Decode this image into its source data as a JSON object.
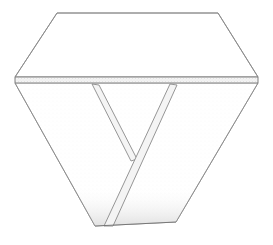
{
  "figure": {
    "title": "",
    "type": "line-drawing",
    "background_color": "#ffffff",
    "stroke_color": "#8a8a8a",
    "stroke_color_dark": "#6f6f6f",
    "stroke_width": 0.9,
    "canvas": {
      "width": 273,
      "height": 245
    },
    "fills": {
      "top_face": "#ffffff",
      "band_face": "#f2f2f2",
      "strut_face": "#f4f4f4",
      "bottom_face": "#ffffff"
    },
    "stipple": {
      "band_color": "#9a9a9a",
      "bottom_color": "#d8d8d8",
      "band_opacity": 0.55,
      "bottom_opacity": 0.35
    },
    "vertices": {
      "top_left_apex": [
        57,
        13
      ],
      "top_right_apex": [
        218,
        13
      ],
      "left_band_top": [
        15,
        77
      ],
      "right_band_top": [
        258,
        77
      ],
      "left_band_bottom": [
        15,
        83
      ],
      "right_band_bottom": [
        258,
        83
      ],
      "bottom_left": [
        95,
        226
      ],
      "bottom_right": [
        176,
        222
      ],
      "strut_left_top_outer": [
        92,
        84
      ],
      "strut_left_top_inner": [
        99,
        85
      ],
      "strut_vee_bottom": [
        131,
        161
      ],
      "strut_right_top_outer": [
        170,
        84
      ],
      "strut_right_top_inner": [
        177,
        85
      ],
      "strut_right_bottom_outer": [
        104,
        226
      ],
      "strut_right_bottom_inner": [
        113,
        226
      ]
    },
    "paths": {
      "top_face": "M 57,13 L 218,13 L 258,77 L 15,77 Z",
      "band": "M 15,77 L 258,77 L 258,83 L 15,83 Z",
      "bottom_face": "M 15,83 L 95,226 L 176,222 L 258,83 Z",
      "left_strut": "M 92,84 L 131,161 L 137,159 L 99,85 Z",
      "right_strut": "M 170,84 L 104,226 L 113,226 L 177,85 Z",
      "bottom_edge": "M 95,226 L 176,222"
    }
  }
}
